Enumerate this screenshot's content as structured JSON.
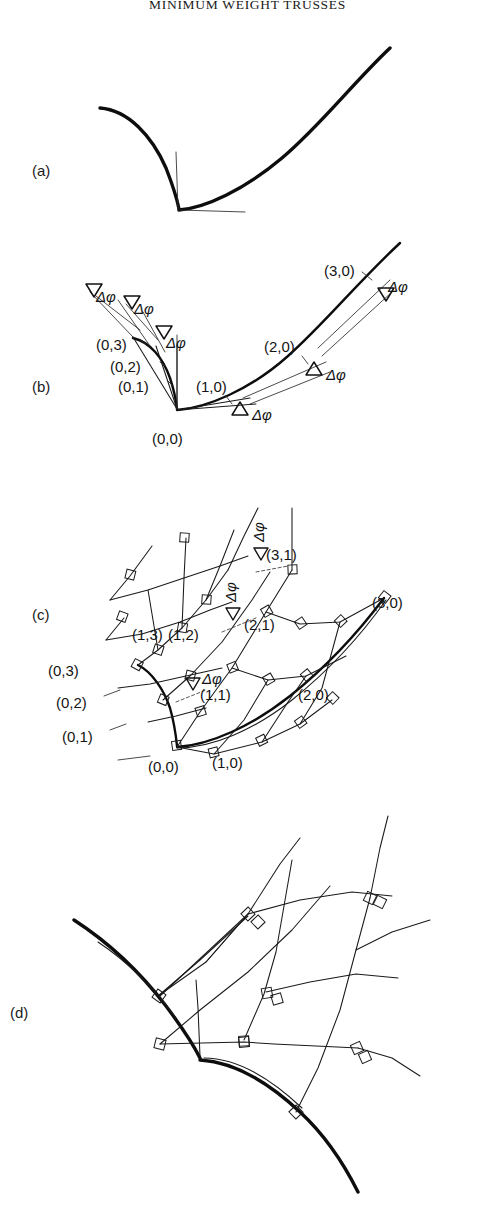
{
  "document": {
    "running_head": "MINIMUM WEIGHT TRUSSES",
    "figure_kind": "line-drawing",
    "background_color": "#ffffff",
    "ink_color": "#0d0d0d"
  },
  "panels": [
    {
      "id": "a",
      "letter": "(a)",
      "caption_text": "",
      "description": "Cusped boundary curve with a left concave branch and a right sweeping branch meeting at a corner point; thin vertical and horizontal reference lines emanate from the corner.",
      "labels": []
    },
    {
      "id": "b",
      "letter": "(b)",
      "caption_text": "",
      "description": "Same boundary curve subdivided into chords with equal turning angles; tangent rays fan out from each node.",
      "labels": [
        {
          "text": "(0,0)",
          "role": "node-label"
        },
        {
          "text": "(0,1)",
          "role": "node-label"
        },
        {
          "text": "(0,2)",
          "role": "node-label"
        },
        {
          "text": "(0,3)",
          "role": "node-label"
        },
        {
          "text": "(1,0)",
          "role": "node-label"
        },
        {
          "text": "(2,0)",
          "role": "node-label"
        },
        {
          "text": "(3,0)",
          "role": "node-label"
        }
      ],
      "angle_markers": [
        {
          "text": "Δφ",
          "role": "turning-angle"
        },
        {
          "text": "Δφ",
          "role": "turning-angle"
        },
        {
          "text": "Δφ",
          "role": "turning-angle"
        },
        {
          "text": "Δφ",
          "role": "turning-angle"
        },
        {
          "text": "Δφ",
          "role": "turning-angle"
        },
        {
          "text": "Δφ",
          "role": "turning-angle"
        }
      ]
    },
    {
      "id": "c",
      "letter": "(c)",
      "caption_text": "",
      "description": "Orthogonal net constructed from the two boundary branches; small open squares mark right angles at every mesh intersection.",
      "labels": [
        {
          "text": "(0,0)",
          "role": "node-label"
        },
        {
          "text": "(0,1)",
          "role": "node-label"
        },
        {
          "text": "(0,2)",
          "role": "node-label"
        },
        {
          "text": "(0,3)",
          "role": "node-label"
        },
        {
          "text": "(1,0)",
          "role": "node-label"
        },
        {
          "text": "(1,1)",
          "role": "node-label"
        },
        {
          "text": "(1,2)",
          "role": "node-label"
        },
        {
          "text": "(1,3)",
          "role": "node-label"
        },
        {
          "text": "(2,0)",
          "role": "node-label"
        },
        {
          "text": "(2,1)",
          "role": "node-label"
        },
        {
          "text": "(3,0)",
          "role": "node-label"
        },
        {
          "text": "(3,1)",
          "role": "node-label"
        }
      ],
      "angle_markers": [
        {
          "text": "Δφ",
          "role": "turning-angle"
        },
        {
          "text": "Δφ",
          "role": "turning-angle"
        },
        {
          "text": "Δφ",
          "role": "turning-angle"
        }
      ]
    },
    {
      "id": "d",
      "letter": "(d)",
      "caption_text": "",
      "description": "Extended orthogonal net continued beyond the labelled region, with right-angle squares at the intersections and mesh lines running off the figure.",
      "labels": [],
      "angle_markers": []
    }
  ],
  "symbols": {
    "delta_phi": "Δφ",
    "right_angle_marker": "open-square"
  }
}
